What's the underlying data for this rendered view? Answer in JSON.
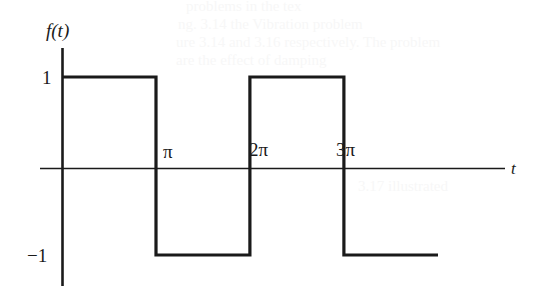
{
  "figure": {
    "kind": "square-wave-plot",
    "ink_color": "#1a1a1a",
    "background_color": "#ffffff",
    "axis_labels": {
      "y": "f(t)",
      "x": "t"
    },
    "y_ticks": [
      {
        "label": "1",
        "value": 1
      },
      {
        "label": "−1",
        "value": -1
      }
    ],
    "x_ticks": [
      {
        "label": "π",
        "value": 3.14159
      },
      {
        "label": "2π",
        "value": 6.28319
      },
      {
        "label": "3π",
        "value": 9.42478
      }
    ]
  },
  "chart_data": {
    "type": "line",
    "title": "",
    "xlabel": "t",
    "ylabel": "f(t)",
    "xlim": [
      0,
      12.57
    ],
    "ylim": [
      -1.45,
      1.45
    ],
    "grid": false,
    "legend": null,
    "series": [
      {
        "name": "f(t)",
        "kind": "step",
        "color": "#1a1a1a",
        "linewidth": 3,
        "x": [
          0,
          3.14159,
          3.14159,
          6.28319,
          6.28319,
          9.42478,
          9.42478,
          12.57
        ],
        "y": [
          1,
          1,
          -1,
          -1,
          1,
          1,
          -1,
          -1
        ],
        "segments": [
          {
            "x_start": 0,
            "x_end": 3.14159,
            "y": 1
          },
          {
            "x_start": 3.14159,
            "x_end": 6.28319,
            "y": -1
          },
          {
            "x_start": 6.28319,
            "x_end": 9.42478,
            "y": 1
          },
          {
            "x_start": 9.42478,
            "x_end": 12.57,
            "y": -1
          }
        ]
      }
    ],
    "xticks": [
      3.14159,
      6.28319,
      9.42478
    ],
    "xticklabels": [
      "π",
      "2π",
      "3π"
    ],
    "yticks": [
      1,
      -1
    ],
    "yticklabels": [
      "1",
      "−1"
    ]
  },
  "ghost_text": {
    "note": "faint show-through from reverse page",
    "lines": [
      "problems in the tex",
      "ng. 3.14 the Vibration problem",
      "ure 3.14 and 3.16 respectively. The problem",
      "are the effect of damping"
    ],
    "right_lines": [
      "that the",
      "first",
      "c"
    ],
    "lower": "3.17 illustrated"
  }
}
